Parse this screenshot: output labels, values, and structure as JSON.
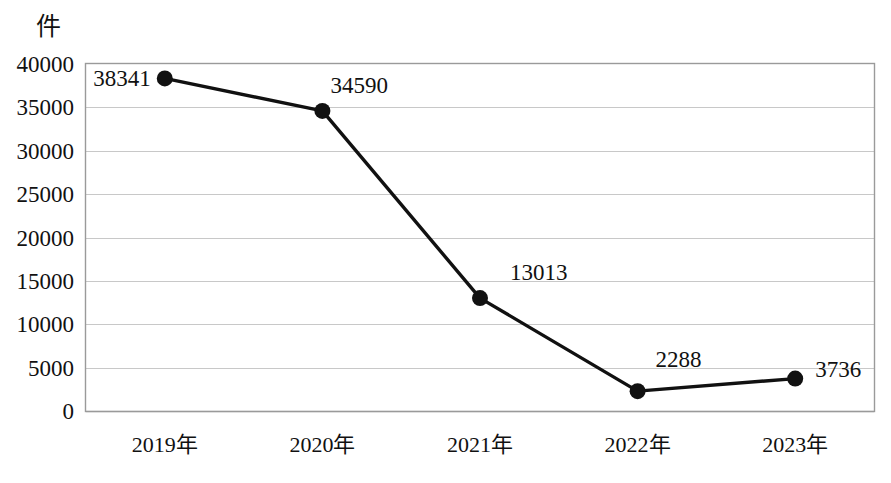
{
  "chart_data": {
    "type": "line",
    "title": "",
    "xlabel": "",
    "ylabel": "件",
    "categories": [
      "2019年",
      "2020年",
      "2021年",
      "2022年",
      "2023年"
    ],
    "values": [
      38341,
      34590,
      13013,
      2288,
      3736
    ],
    "series": [
      {
        "name": "件数",
        "values": [
          38341,
          34590,
          13013,
          2288,
          3736
        ]
      }
    ],
    "point_labels": [
      "38341",
      "34590",
      "13013",
      "2288",
      "3736"
    ],
    "ylim": [
      0,
      40000
    ],
    "ytick_labels": [
      "0",
      "5000",
      "10000",
      "15000",
      "20000",
      "25000",
      "30000",
      "35000",
      "40000"
    ],
    "ytick_values": [
      0,
      5000,
      10000,
      15000,
      20000,
      25000,
      30000,
      35000,
      40000
    ],
    "grid": "horizontal",
    "legend": "none",
    "marker": "filled-circle",
    "colors": {
      "line": "#111111",
      "marker": "#111111",
      "gridline": "#c8c8c8",
      "axis": "#8a8a8a",
      "text": "#111111",
      "background": "#ffffff"
    }
  }
}
